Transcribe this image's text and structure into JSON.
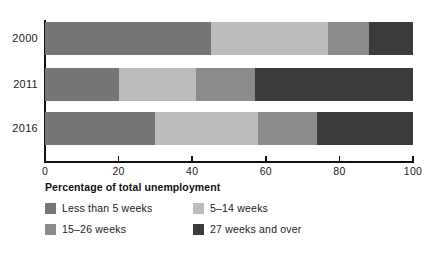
{
  "chart_data": {
    "type": "bar",
    "orientation": "horizontal",
    "stacked": true,
    "title": "",
    "xlabel": "Percentage of total unemployment",
    "ylabel": "",
    "xlim": [
      0,
      100
    ],
    "xticks": [
      0,
      20,
      40,
      60,
      80,
      100
    ],
    "xtick_labels": [
      "0",
      "20",
      "40",
      "60",
      "80",
      "100"
    ],
    "grid": false,
    "legend_position": "bottom-left",
    "categories": [
      "2000",
      "2011",
      "2016"
    ],
    "series": [
      {
        "name": "Less than 5 weeks",
        "color": "#767679",
        "values": [
          45,
          20,
          30
        ]
      },
      {
        "name": "5–14 weeks",
        "color": "#bcbcbc",
        "values": [
          32,
          21,
          28
        ]
      },
      {
        "name": "15–26 weeks",
        "color": "#8b8b8d",
        "values": [
          11,
          16,
          16
        ]
      },
      {
        "name": "27 weeks and over",
        "color": "#3b3b3e",
        "values": [
          12,
          43,
          26
        ]
      }
    ]
  },
  "axis": {
    "x_title": "Percentage of total unemployment",
    "ticks": [
      {
        "value": 0,
        "label": "0"
      },
      {
        "value": 20,
        "label": "20"
      },
      {
        "value": 40,
        "label": "40"
      },
      {
        "value": 60,
        "label": "60"
      },
      {
        "value": 80,
        "label": "80"
      },
      {
        "value": 100,
        "label": "100"
      }
    ]
  },
  "rows": [
    {
      "year": "2000",
      "segments": [
        45,
        32,
        11,
        12
      ]
    },
    {
      "year": "2011",
      "segments": [
        20,
        21,
        16,
        43
      ]
    },
    {
      "year": "2016",
      "segments": [
        30,
        28,
        16,
        26
      ]
    }
  ],
  "legend": {
    "items": [
      {
        "label": "Less than 5 weeks",
        "color": "#767679"
      },
      {
        "label": "5–14 weeks",
        "color": "#bcbcbc"
      },
      {
        "label": "15–26 weeks",
        "color": "#8b8b8d"
      },
      {
        "label": "27 weeks and over",
        "color": "#3b3b3e"
      }
    ]
  },
  "colors": {
    "axis": "#111113",
    "text": "#1a1a1a",
    "background": "#ffffff"
  }
}
